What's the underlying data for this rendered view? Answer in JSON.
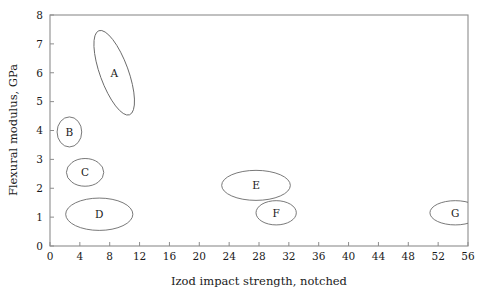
{
  "chart_data": {
    "type": "scatter",
    "title": "",
    "xlabel": "Izod impact strength, notched",
    "ylabel": "Flexural modulus, GPa",
    "xlim": [
      0,
      56
    ],
    "ylim": [
      0,
      8
    ],
    "xticks": [
      0,
      4,
      8,
      12,
      16,
      20,
      24,
      28,
      32,
      36,
      40,
      44,
      48,
      52,
      56
    ],
    "xtick_labels": [
      "0",
      "4",
      "8",
      "12",
      "16",
      "20",
      "24",
      "28",
      "32",
      "36",
      "40",
      "44",
      "48",
      "52",
      "56"
    ],
    "yticks": [
      0,
      1,
      2,
      3,
      4,
      5,
      6,
      7,
      8
    ],
    "ytick_labels": [
      "0",
      "1",
      "2",
      "3",
      "4",
      "5",
      "6",
      "7",
      "8"
    ],
    "grid": false,
    "legend": "none",
    "frame": "box",
    "regions": [
      {
        "label": "A",
        "cx": 8.6,
        "cy": 6.0,
        "rx": 1.9,
        "ry": 1.55,
        "rotation": -20,
        "x_range": [
          5.6,
          11.6
        ],
        "y_range": [
          4.6,
          7.4
        ]
      },
      {
        "label": "B",
        "cx": 2.6,
        "cy": 3.95,
        "rx": 1.65,
        "ry": 0.52,
        "rotation": 0,
        "x_range": [
          1.0,
          4.3
        ],
        "y_range": [
          3.43,
          4.47
        ]
      },
      {
        "label": "C",
        "cx": 4.7,
        "cy": 2.55,
        "rx": 2.5,
        "ry": 0.48,
        "rotation": 0,
        "x_range": [
          2.2,
          7.2
        ],
        "y_range": [
          2.07,
          3.03
        ]
      },
      {
        "label": "D",
        "cx": 6.6,
        "cy": 1.1,
        "rx": 4.5,
        "ry": 0.56,
        "rotation": 0,
        "x_range": [
          2.1,
          11.1
        ],
        "y_range": [
          0.54,
          1.66
        ]
      },
      {
        "label": "E",
        "cx": 27.6,
        "cy": 2.1,
        "rx": 4.6,
        "ry": 0.52,
        "rotation": 0,
        "x_range": [
          23.0,
          32.2
        ],
        "y_range": [
          1.58,
          2.62
        ]
      },
      {
        "label": "F",
        "cx": 30.3,
        "cy": 1.15,
        "rx": 2.7,
        "ry": 0.42,
        "rotation": 0,
        "x_range": [
          27.6,
          33.0
        ],
        "y_range": [
          0.73,
          1.57
        ]
      },
      {
        "label": "G",
        "cx": 54.3,
        "cy": 1.15,
        "rx": 3.4,
        "ry": 0.42,
        "rotation": 0,
        "x_range": [
          50.9,
          57.7
        ],
        "y_range": [
          0.73,
          1.57
        ]
      }
    ]
  }
}
